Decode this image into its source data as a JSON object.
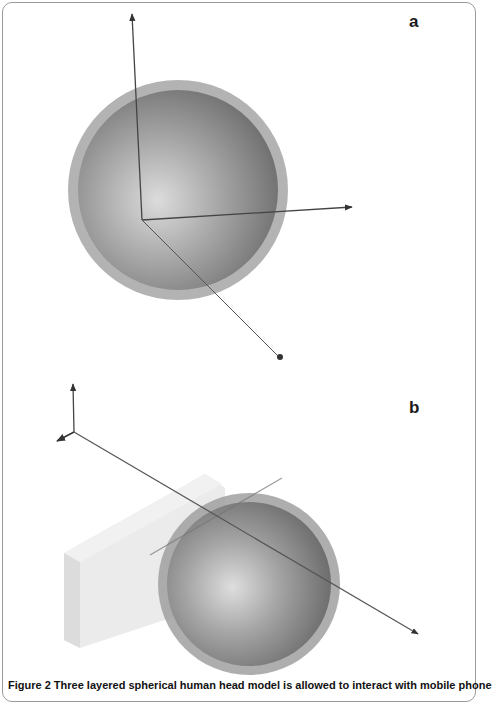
{
  "figure": {
    "panels": [
      {
        "label": "a",
        "description": "Three layered sphere (head model) with x/y/z coordinate axes and a point source"
      },
      {
        "label": "b",
        "description": "Sphere (head model) beside rectangular block (mobile phone) with axis triad"
      }
    ],
    "caption": "Figure 2 Three layered spherical human head model is allowed to interact with mobile phone",
    "colors": {
      "sphere_outer": "#9c9c9c",
      "sphere_inner_highlight": "#d8d8d8",
      "sphere_dark": "#6e6e6e",
      "axis": "#555555",
      "phone_block": "#e6e6e6",
      "frame_border": "#9a9a9a"
    }
  }
}
